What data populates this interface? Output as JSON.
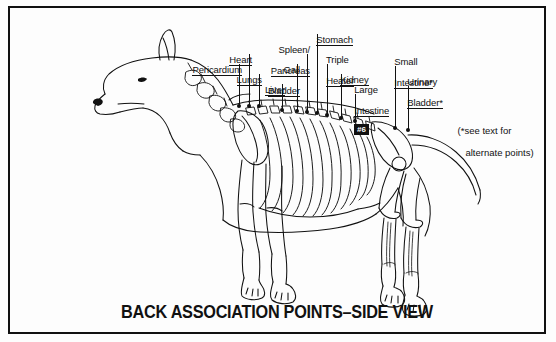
{
  "figure": {
    "title": "BACK ASSOCIATION POINTS–SIDE VIEW",
    "note_line1": "(*see text for",
    "note_line2": "   alternate points)",
    "marker_label": "#6",
    "border_color": "#111111",
    "background_color": "#fdfdfd",
    "ink_color": "#111111"
  },
  "labels": [
    {
      "id": "pericardium",
      "text": "Pericardium"
    },
    {
      "id": "heart",
      "text": "Heart"
    },
    {
      "id": "lungs",
      "text": "Lungs"
    },
    {
      "id": "spleen",
      "text": "Spleen/"
    },
    {
      "id": "pancreas",
      "text": "Pancreas"
    },
    {
      "id": "gall",
      "text": "Gall"
    },
    {
      "id": "bladder",
      "text": "Bladder"
    },
    {
      "id": "liver",
      "text": "Liver"
    },
    {
      "id": "stomach",
      "text": "Stomach"
    },
    {
      "id": "triple",
      "text": "Triple"
    },
    {
      "id": "heater",
      "text": "Heater"
    },
    {
      "id": "kidney",
      "text": "Kidney"
    },
    {
      "id": "large",
      "text": "Large"
    },
    {
      "id": "intestine",
      "text": "Intestine"
    },
    {
      "id": "small",
      "text": "Small"
    },
    {
      "id": "small-intestine",
      "text": "Intestine*"
    },
    {
      "id": "urinary",
      "text": "Urinary"
    },
    {
      "id": "urinary-bladder",
      "text": "Bladder*"
    }
  ]
}
